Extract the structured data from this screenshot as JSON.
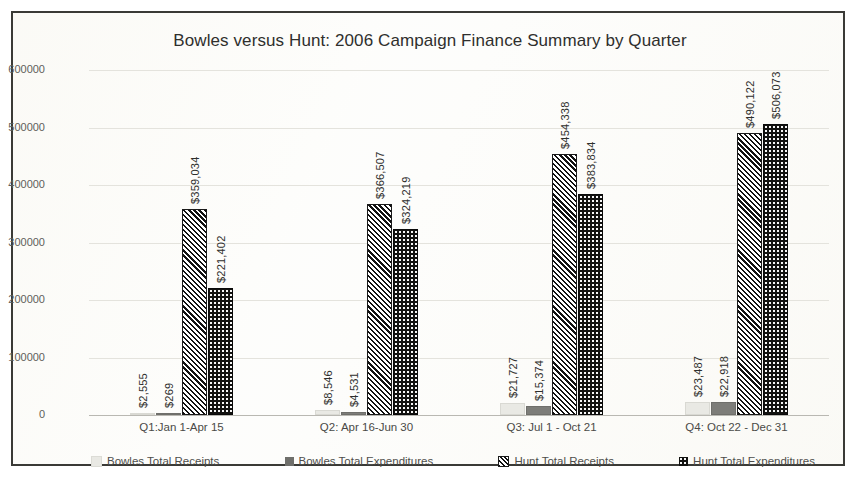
{
  "chart_data": {
    "type": "bar",
    "title": "Bowles versus Hunt: 2006 Campaign Finance Summary by Quarter",
    "xlabel": "",
    "ylabel": "",
    "ylim": [
      0,
      600000
    ],
    "yticks": [
      "0",
      "100000",
      "200000",
      "300000",
      "400000",
      "500000",
      "600000"
    ],
    "grid": true,
    "legend_position": "bottom",
    "categories": [
      "Q1:Jan 1-Apr 15",
      "Q2: Apr 16-Jun 30",
      "Q3: Jul 1 - Oct 21",
      "Q4: Oct 22 - Dec 31"
    ],
    "series": [
      {
        "name": "Bowles Total Receipts",
        "color": "#e9e9e4",
        "pattern": "solid-light-gray",
        "values": [
          2555,
          8546,
          21727,
          23487
        ],
        "labels": [
          "$2,555",
          "$8,546",
          "$21,727",
          "$23,487"
        ]
      },
      {
        "name": "Bowles Total Expenditures",
        "color": "#7d7d79",
        "pattern": "solid-mid-gray",
        "values": [
          269,
          4531,
          15374,
          22918
        ],
        "labels": [
          "$269",
          "$4,531",
          "$15,374",
          "$22,918"
        ]
      },
      {
        "name": "Hunt Total Receipts",
        "color": "#111111",
        "pattern": "diagonal-hatch",
        "values": [
          359034,
          366507,
          454338,
          490122
        ],
        "labels": [
          "$359,034",
          "$366,507",
          "$454,338",
          "$490,122"
        ]
      },
      {
        "name": "Hunt Total Expenditures",
        "color": "#121210",
        "pattern": "black-dotted",
        "values": [
          221402,
          324219,
          383834,
          506073
        ],
        "labels": [
          "$221,402",
          "$324,219",
          "$383,834",
          "$506,073"
        ]
      }
    ]
  },
  "legend": {
    "items": [
      "Bowles Total Receipts",
      "Bowles Total Expenditures",
      "Hunt Total Receipts",
      "Hunt Total Expenditures"
    ]
  }
}
